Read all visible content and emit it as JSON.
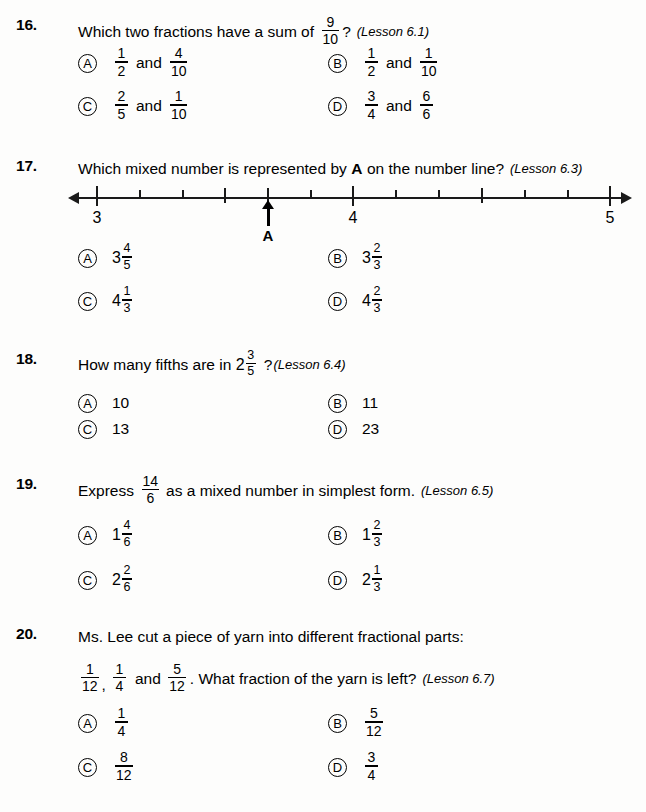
{
  "questions": [
    {
      "number": "16.",
      "prompt_pre": "Which two fractions have a sum of",
      "prompt_frac": {
        "num": "9",
        "den": "10"
      },
      "prompt_post": "?",
      "lesson": "(Lesson 6.1)",
      "options": [
        {
          "letter": "A",
          "f1": {
            "num": "1",
            "den": "2"
          },
          "conj": "and",
          "f2": {
            "num": "4",
            "den": "10"
          }
        },
        {
          "letter": "B",
          "f1": {
            "num": "1",
            "den": "2"
          },
          "conj": "and",
          "f2": {
            "num": "1",
            "den": "10"
          }
        },
        {
          "letter": "C",
          "f1": {
            "num": "2",
            "den": "5"
          },
          "conj": "and",
          "f2": {
            "num": "1",
            "den": "10"
          }
        },
        {
          "letter": "D",
          "f1": {
            "num": "3",
            "den": "4"
          },
          "conj": "and",
          "f2": {
            "num": "6",
            "den": "6"
          }
        }
      ]
    },
    {
      "number": "17.",
      "prompt_pre": "Which mixed number is represented by",
      "prompt_bold": "A",
      "prompt_post": "on the number line?",
      "lesson": "(Lesson 6.3)",
      "options": [
        {
          "letter": "A",
          "whole": "3",
          "num": "4",
          "den": "5"
        },
        {
          "letter": "B",
          "whole": "3",
          "num": "2",
          "den": "3"
        },
        {
          "letter": "C",
          "whole": "4",
          "num": "1",
          "den": "3"
        },
        {
          "letter": "D",
          "whole": "4",
          "num": "2",
          "den": "3"
        }
      ]
    },
    {
      "number": "18.",
      "prompt_pre": "How many fifths are in",
      "mixed": {
        "whole": "2",
        "num": "3",
        "den": "5"
      },
      "prompt_post": "?",
      "lesson": "(Lesson 6.4)",
      "options": [
        {
          "letter": "A",
          "text": "10"
        },
        {
          "letter": "B",
          "text": "11"
        },
        {
          "letter": "C",
          "text": "13"
        },
        {
          "letter": "D",
          "text": "23"
        }
      ]
    },
    {
      "number": "19.",
      "prompt_pre": "Express",
      "prompt_frac": {
        "num": "14",
        "den": "6"
      },
      "prompt_post": "as a mixed number in simplest form.",
      "lesson": "(Lesson 6.5)",
      "options": [
        {
          "letter": "A",
          "whole": "1",
          "num": "4",
          "den": "6"
        },
        {
          "letter": "B",
          "whole": "1",
          "num": "2",
          "den": "3"
        },
        {
          "letter": "C",
          "whole": "2",
          "num": "2",
          "den": "6"
        },
        {
          "letter": "D",
          "whole": "2",
          "num": "1",
          "den": "3"
        }
      ]
    },
    {
      "number": "20.",
      "line1": "Ms. Lee cut a piece of yarn into different fractional parts:",
      "line2_f1": {
        "num": "1",
        "den": "12"
      },
      "line2_sep1": ",",
      "line2_f2": {
        "num": "1",
        "den": "4"
      },
      "line2_conj": "and",
      "line2_f3": {
        "num": "5",
        "den": "12"
      },
      "line2_post": ". What fraction of the yarn is left?",
      "lesson": "(Lesson 6.7)",
      "options": [
        {
          "letter": "A",
          "num": "1",
          "den": "4"
        },
        {
          "letter": "B",
          "num": "5",
          "den": "12"
        },
        {
          "letter": "C",
          "num": "8",
          "den": "12"
        },
        {
          "letter": "D",
          "num": "3",
          "den": "4"
        }
      ]
    }
  ],
  "number_line": {
    "labels": [
      {
        "text": "3",
        "x": 97
      },
      {
        "text": "4",
        "x": 353
      },
      {
        "text": "5",
        "x": 610
      }
    ],
    "marker_label": "A",
    "marker_x": 268,
    "major_ticks": [
      97,
      353,
      610
    ],
    "mid_ticks": [
      225,
      268,
      482
    ],
    "minor_ticks": [
      140,
      183,
      311,
      396,
      439,
      525,
      568
    ],
    "axis_min": 3,
    "axis_max": 5,
    "divisions_per_unit": 6,
    "marker_value": "3 2/3"
  }
}
